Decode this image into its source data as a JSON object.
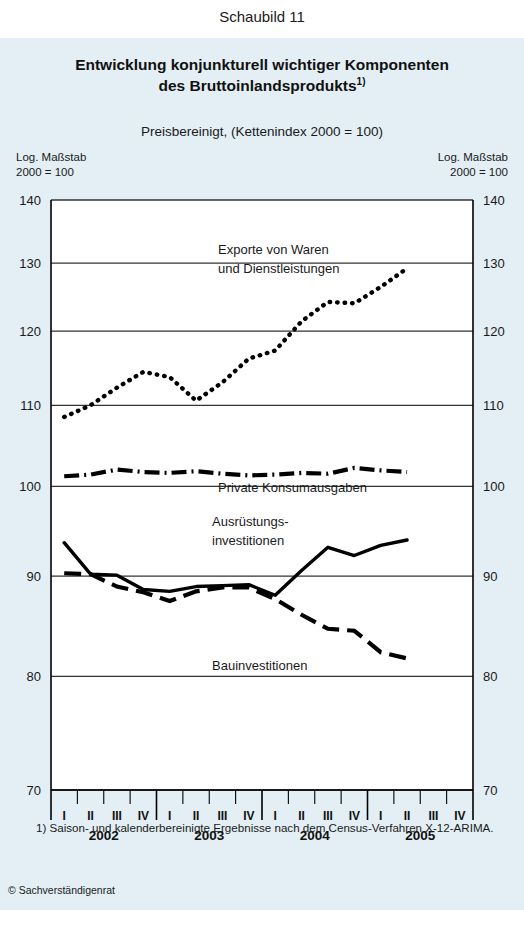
{
  "figure_caption": "Schaubild 11",
  "title_line1": "Entwicklung konjunkturell wichtiger Komponenten",
  "title_line2": "des Bruttoinlandsprodukts",
  "title_footnote_marker": "1)",
  "subtitle": "Preisbereinigt, (Kettenindex 2000 = 100)",
  "scale_note": {
    "line1": "Log. Maßstab",
    "line2": "2000 = 100"
  },
  "footnote": "1) Saison- und kalenderbereinigte Ergebnisse nach dem Census-Verfahren X-12-ARIMA.",
  "credit": "© Sachverständigenrat",
  "chart_data": {
    "type": "line",
    "title": "Entwicklung konjunkturell wichtiger Komponenten des Bruttoinlandsprodukts",
    "subtitle": "Preisbereinigt, (Kettenindex 2000 = 100)",
    "xlabel": "",
    "ylabel": "Log. Maßstab 2000 = 100",
    "scale": "log",
    "ylim": [
      70,
      140
    ],
    "yticks": [
      70,
      80,
      90,
      100,
      110,
      120,
      130,
      140
    ],
    "grid": true,
    "legend_position": "inline-annotations",
    "years": [
      "2002",
      "2003",
      "2004",
      "2005"
    ],
    "quarters": [
      "I",
      "II",
      "III",
      "IV"
    ],
    "x": [
      "2002 I",
      "2002 II",
      "2002 III",
      "2002 IV",
      "2003 I",
      "2003 II",
      "2003 III",
      "2003 IV",
      "2004 I",
      "2004 II",
      "2004 III",
      "2004 IV",
      "2005 I",
      "2005 II"
    ],
    "series": [
      {
        "name": "Exporte von Waren und Dienstleistungen",
        "label_line1": "Exporte von Waren",
        "label_line2": "und Dienstleistungen",
        "style": "dotted",
        "values": [
          108.5,
          110.0,
          112.3,
          114.4,
          113.7,
          110.6,
          113.0,
          116.2,
          117.3,
          121.4,
          124.2,
          124.0,
          126.4,
          129.2
        ]
      },
      {
        "name": "Private Konsumausgaben",
        "label_line1": "Private Konsumausgaben",
        "style": "dash-dot",
        "values": [
          101.2,
          101.4,
          102.0,
          101.7,
          101.6,
          101.8,
          101.5,
          101.3,
          101.4,
          101.6,
          101.5,
          102.2,
          101.9,
          101.7
        ]
      },
      {
        "name": "Ausrüstungsinvestitionen",
        "label_line1": "Ausrüstungs-",
        "label_line2": "investitionen",
        "style": "solid",
        "values": [
          93.6,
          90.2,
          90.1,
          88.6,
          88.4,
          88.9,
          89.0,
          89.1,
          88.0,
          90.6,
          93.1,
          92.2,
          93.3,
          93.9
        ]
      },
      {
        "name": "Bauinvestitionen",
        "label_line1": "Bauinvestitionen",
        "style": "dashed",
        "values": [
          90.3,
          90.2,
          88.9,
          88.3,
          87.4,
          88.4,
          88.8,
          88.8,
          87.6,
          86.0,
          84.6,
          84.4,
          82.3,
          81.7
        ]
      }
    ]
  }
}
